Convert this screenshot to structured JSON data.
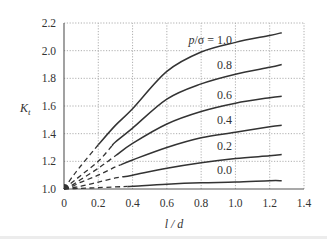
{
  "chart_data": {
    "type": "line",
    "title": "",
    "xlabel": "l / d",
    "ylabel": "K_t",
    "xlim": [
      0,
      1.4
    ],
    "ylim": [
      1.0,
      2.2
    ],
    "xticks": [
      0,
      0.2,
      0.4,
      0.6,
      0.8,
      1.0,
      1.2,
      1.4
    ],
    "xtick_labels": [
      "0",
      "0.2",
      "0.4",
      "0.6",
      "0.8",
      "1.0",
      "1.2",
      "1.4"
    ],
    "yticks": [
      1.0,
      1.2,
      1.4,
      1.6,
      1.8,
      2.0,
      2.2
    ],
    "ytick_labels": [
      "1.0",
      "1.2",
      "1.4",
      "1.6",
      "1.8",
      "2.0",
      "2.2"
    ],
    "grid": true,
    "grid_style": "dotted",
    "legend": "inline labels right-aligned near l/d = 1.0",
    "line_color": "#333333",
    "annotation": "dashed segments indicate extrapolated region for small l/d",
    "series": [
      {
        "name": "p/σ = 1.0",
        "label": "p/σ = 1.0",
        "dash_until": 0.2,
        "x": [
          0,
          0.05,
          0.1,
          0.2,
          0.3,
          0.4,
          0.6,
          0.8,
          1.0,
          1.2,
          1.27
        ],
        "y": [
          1.0,
          1.09,
          1.17,
          1.32,
          1.46,
          1.58,
          1.85,
          1.99,
          2.06,
          2.11,
          2.13
        ]
      },
      {
        "name": "p/σ = 0.8",
        "label": "0.8",
        "dash_until": 0.28,
        "x": [
          0,
          0.05,
          0.1,
          0.2,
          0.3,
          0.4,
          0.6,
          0.8,
          1.0,
          1.2,
          1.27
        ],
        "y": [
          1.0,
          1.05,
          1.1,
          1.2,
          1.34,
          1.44,
          1.65,
          1.76,
          1.83,
          1.88,
          1.9
        ]
      },
      {
        "name": "p/σ = 0.6",
        "label": "0.6",
        "dash_until": 0.31,
        "x": [
          0,
          0.05,
          0.1,
          0.2,
          0.3,
          0.4,
          0.6,
          0.8,
          1.0,
          1.2,
          1.27
        ],
        "y": [
          1.0,
          1.03,
          1.07,
          1.15,
          1.24,
          1.33,
          1.47,
          1.56,
          1.62,
          1.66,
          1.67
        ]
      },
      {
        "name": "p/σ = 0.4",
        "label": "0.4",
        "dash_until": 0.33,
        "x": [
          0,
          0.05,
          0.1,
          0.2,
          0.3,
          0.4,
          0.6,
          0.8,
          1.0,
          1.2,
          1.27
        ],
        "y": [
          1.0,
          1.02,
          1.05,
          1.1,
          1.16,
          1.21,
          1.3,
          1.37,
          1.41,
          1.45,
          1.46
        ]
      },
      {
        "name": "p/σ = 0.2",
        "label": "0.2",
        "dash_until": 0.34,
        "x": [
          0,
          0.05,
          0.1,
          0.2,
          0.3,
          0.4,
          0.6,
          0.8,
          1.0,
          1.2,
          1.27
        ],
        "y": [
          1.0,
          1.01,
          1.02,
          1.05,
          1.08,
          1.1,
          1.15,
          1.19,
          1.22,
          1.24,
          1.25
        ]
      },
      {
        "name": "p/σ = 0.0",
        "label": "0.0",
        "dash_until": 0.37,
        "x": [
          0,
          0.1,
          0.2,
          0.4,
          0.6,
          0.8,
          1.0,
          1.2,
          1.27
        ],
        "y": [
          1.0,
          1.005,
          1.01,
          1.02,
          1.035,
          1.045,
          1.05,
          1.06,
          1.06
        ]
      }
    ],
    "label_positions": {
      "p/σ = 1.0": 2.08,
      "0.8": 1.9,
      "0.6": 1.68,
      "0.4": 1.5,
      "0.2": 1.31,
      "0.0": 1.14
    }
  }
}
